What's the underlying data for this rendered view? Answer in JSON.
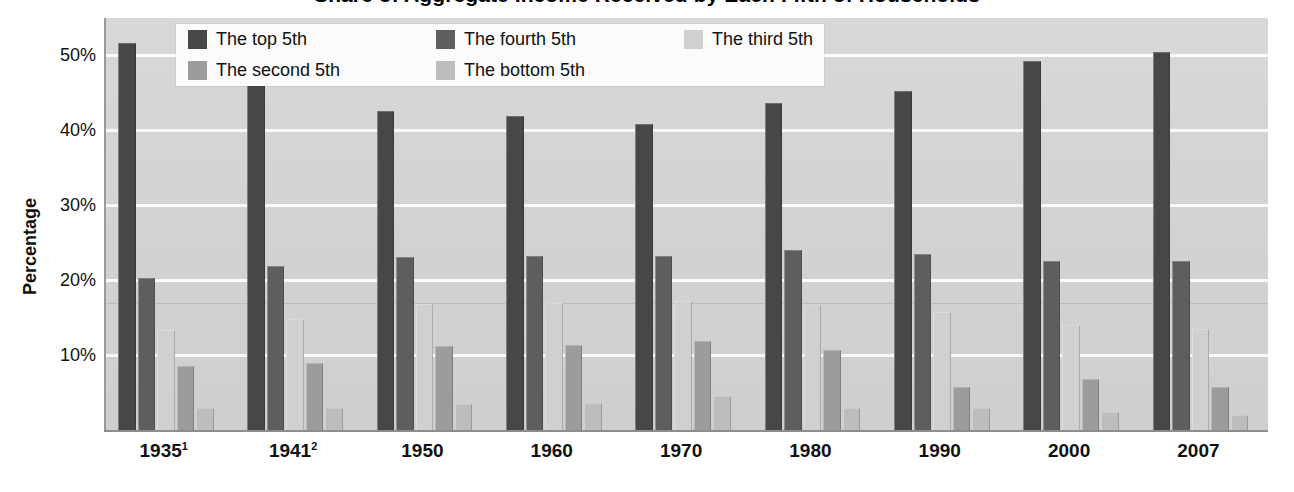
{
  "chart_data": {
    "type": "bar",
    "title": "Share of Aggregate Income Received by Each Fifth of Households",
    "xlabel": "",
    "ylabel": "Percentage",
    "ylim": [
      0,
      55
    ],
    "yticks": [
      10,
      20,
      30,
      40,
      50
    ],
    "ytick_labels": [
      "10%",
      "20%",
      "30%",
      "40%",
      "50%"
    ],
    "grid": true,
    "legend_position": "top-center",
    "categories": [
      "1935¹",
      "1941²",
      "1950",
      "1960",
      "1970",
      "1980",
      "1990",
      "2000",
      "2007"
    ],
    "series": [
      {
        "name": "The top 5th",
        "color": "#474747",
        "values": [
          51.7,
          48.8,
          42.6,
          41.9,
          40.8,
          43.7,
          45.2,
          49.3,
          50.5
        ]
      },
      {
        "name": "The fourth 5th",
        "color": "#5e5e5e",
        "values": [
          20.3,
          21.9,
          23.1,
          23.2,
          23.2,
          24.0,
          23.5,
          22.6,
          22.5
        ]
      },
      {
        "name": "The third 5th",
        "color": "#d0d0d0",
        "values": [
          13.4,
          14.8,
          16.8,
          16.9,
          17.2,
          16.7,
          15.8,
          14.0,
          13.5
        ]
      },
      {
        "name": "The second 5th",
        "color": "#9c9c9c",
        "values": [
          8.5,
          9.0,
          11.2,
          11.4,
          11.9,
          10.7,
          5.8,
          6.8,
          5.8
        ]
      },
      {
        "name": "The bottom 5th",
        "color": "#bdbdbd",
        "values": [
          3.0,
          3.0,
          3.5,
          3.6,
          4.5,
          3.0,
          3.0,
          2.4,
          2.0
        ]
      }
    ],
    "legend_order": [
      "The top 5th",
      "The fourth 5th",
      "The third 5th",
      "The second 5th",
      "The bottom 5th"
    ]
  },
  "legend": {
    "items": [
      {
        "label": "The top 5th",
        "color": "#474747"
      },
      {
        "label": "The fourth 5th",
        "color": "#5e5e5e"
      },
      {
        "label": "The third 5th",
        "color": "#d0d0d0"
      },
      {
        "label": "The second 5th",
        "color": "#9c9c9c"
      },
      {
        "label": "The bottom 5th",
        "color": "#bdbdbd"
      }
    ]
  },
  "axes": {
    "y_title": "Percentage",
    "y_tick_labels": [
      "50%",
      "40%",
      "30%",
      "20%",
      "10%"
    ],
    "x_tick_labels": [
      "1935¹",
      "1941²",
      "1950",
      "1960",
      "1970",
      "1980",
      "1990",
      "2000",
      "2007"
    ]
  },
  "colors": {
    "plot_background": "#d5d5d5",
    "gridline": "#fdfdfd",
    "axis_line": "#8d8d8d",
    "legend_background": "#fbfbfb",
    "text": "#111111"
  }
}
